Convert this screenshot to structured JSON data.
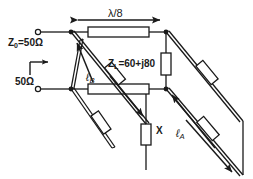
{
  "diagram": {
    "background_color": "#ffffff",
    "line_color": "#1a1a1a",
    "fill_color": "#ffffff",
    "labels": {
      "length_lambda": "λ/8",
      "source_impedance": "Z₀=50Ω",
      "input_impedance": "50Ω",
      "load_impedance": "Zₗ=60+j80",
      "reactance": "X",
      "stub_a_length": "ℓₐ",
      "stub_b_length": "ℓʙ"
    },
    "label_parts": {
      "z0_main": "Z",
      "z0_sub": "0",
      "z0_tail": "=50Ω",
      "zl_main": "Z",
      "zl_sub": "L",
      "zl_tail": "=60+j80",
      "la_main": "ℓ",
      "la_sub": "A",
      "lb_main": "ℓ",
      "lb_sub": "B"
    },
    "terminals": [
      {
        "name": "input-top",
        "x": 38,
        "y": 32
      },
      {
        "name": "input-bottom",
        "x": 38,
        "y": 89
      }
    ],
    "junctions": [
      {
        "name": "top-left-junction",
        "x": 71,
        "y": 32
      },
      {
        "name": "top-right-junction",
        "x": 166,
        "y": 32
      },
      {
        "name": "bottom-left-junction",
        "x": 71,
        "y": 89
      },
      {
        "name": "bottom-right-junction",
        "x": 166,
        "y": 89
      }
    ]
  }
}
